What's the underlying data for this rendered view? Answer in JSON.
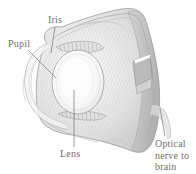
{
  "figure": {
    "style": "pencil-hatched engraving, grayscale",
    "background_color": "#ffffff",
    "ink_color": "#8a8a8a",
    "shade_color": "#c4c4c4",
    "label_color": "#5f5f5f"
  },
  "labels": {
    "iris": "Iris",
    "pupil": "Pupil",
    "lens": "Lens",
    "optic_nerve": {
      "line1": "Optical",
      "line2": "nerve to",
      "line3": "brain"
    }
  },
  "parts": [
    {
      "name": "iris",
      "label": "Iris"
    },
    {
      "name": "pupil",
      "label": "Pupil"
    },
    {
      "name": "lens",
      "label": "Lens"
    },
    {
      "name": "optic-nerve",
      "label": "Optical nerve to brain"
    },
    {
      "name": "sclera",
      "label": ""
    },
    {
      "name": "cornea",
      "label": ""
    },
    {
      "name": "retina",
      "label": ""
    }
  ]
}
